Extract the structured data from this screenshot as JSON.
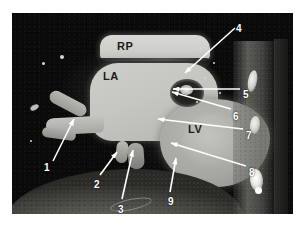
{
  "figure": {
    "kind": "annotated-ct-scan",
    "modality_appearance": "grayscale cardiac CT cross-section",
    "background_color": "#ffffff",
    "scan_background_color": "#0a0a0a"
  },
  "anatomy_labels": [
    {
      "id": "rp",
      "text": "RP",
      "x": 117,
      "y": 41,
      "on_dark": false,
      "meaning": "right pulmonary artery"
    },
    {
      "id": "la",
      "text": "LA",
      "x": 103,
      "y": 71,
      "on_dark": false,
      "meaning": "left atrium"
    },
    {
      "id": "lv",
      "text": "LV",
      "x": 188,
      "y": 124,
      "on_dark": false,
      "meaning": "left ventricle"
    }
  ],
  "callouts": [
    {
      "number": "1",
      "label_x": 44,
      "label_y": 163,
      "line": {
        "x1": 53,
        "y1": 161,
        "x2": 74,
        "y2": 119
      }
    },
    {
      "number": "2",
      "label_x": 94,
      "label_y": 180,
      "line": {
        "x1": 100,
        "y1": 175,
        "x2": 117,
        "y2": 152
      }
    },
    {
      "number": "3",
      "label_x": 118,
      "label_y": 205,
      "line": {
        "x1": 122,
        "y1": 199,
        "x2": 133,
        "y2": 150
      }
    },
    {
      "number": "4",
      "label_x": 236,
      "label_y": 24,
      "line": {
        "x1": 235,
        "y1": 28,
        "x2": 185,
        "y2": 73
      }
    },
    {
      "number": "5",
      "label_x": 243,
      "label_y": 90,
      "line": {
        "x1": 240,
        "y1": 89,
        "x2": 173,
        "y2": 89
      }
    },
    {
      "number": "6",
      "label_x": 233,
      "label_y": 112,
      "line": {
        "x1": 231,
        "y1": 109,
        "x2": 172,
        "y2": 92
      }
    },
    {
      "number": "7",
      "label_x": 246,
      "label_y": 131,
      "line": {
        "x1": 243,
        "y1": 129,
        "x2": 158,
        "y2": 119
      }
    },
    {
      "number": "8",
      "label_x": 249,
      "label_y": 168,
      "line": {
        "x1": 246,
        "y1": 166,
        "x2": 171,
        "y2": 143
      }
    },
    {
      "number": "9",
      "label_x": 168,
      "label_y": 197,
      "line": {
        "x1": 170,
        "y1": 192,
        "x2": 176,
        "y2": 158
      }
    }
  ],
  "arrow_style": {
    "stroke_color": "#ffffff",
    "stroke_width": 1.6,
    "head_length": 7,
    "head_width": 4
  },
  "speckles": [
    {
      "x": 60,
      "y": 55,
      "d": 4
    },
    {
      "x": 42,
      "y": 62,
      "d": 3
    },
    {
      "x": 199,
      "y": 47,
      "d": 3
    },
    {
      "x": 213,
      "y": 62,
      "d": 2
    },
    {
      "x": 204,
      "y": 77,
      "d": 2
    },
    {
      "x": 219,
      "y": 92,
      "d": 2
    },
    {
      "x": 196,
      "y": 101,
      "d": 2
    },
    {
      "x": 30,
      "y": 140,
      "d": 2
    }
  ]
}
